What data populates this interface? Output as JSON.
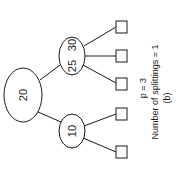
{
  "diagram": {
    "type": "b-tree",
    "orientation": "rotated 90deg counter-clockwise",
    "root": {
      "keys": "20"
    },
    "internal_nodes": [
      {
        "keys_a": "25",
        "keys_b": "30"
      },
      {
        "keys": "10"
      }
    ],
    "leaf_count": 5,
    "caption": {
      "p_label": "p = 3",
      "splittings_label": "Number of splittings  =  1",
      "figure_label": "(b)"
    }
  },
  "colors": {
    "stroke": "#1a1a1a",
    "background": "#ffffff"
  }
}
